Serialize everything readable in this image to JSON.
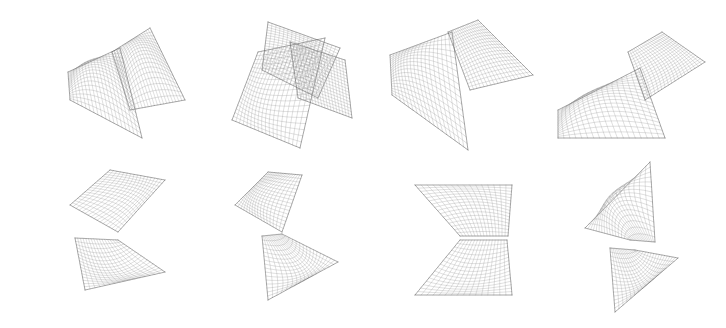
{
  "figure": {
    "background": "#ffffff",
    "line_color": "#8a8a8a",
    "dense_color": "#555555",
    "rows": 2,
    "columns": 4
  },
  "surfaces": [
    {
      "id": "top-1",
      "name": "surface-top-1",
      "grid": 18,
      "patches": [
        {
          "p00": [
            68,
            72
          ],
          "p10": [
            120,
            48
          ],
          "p01": [
            70,
            100
          ],
          "p11": [
            142,
            138
          ],
          "c": [
            96,
            70
          ]
        },
        {
          "p00": [
            112,
            52
          ],
          "p10": [
            150,
            28
          ],
          "p01": [
            130,
            110
          ],
          "p11": [
            185,
            100
          ],
          "c": [
            140,
            55
          ]
        }
      ]
    },
    {
      "id": "top-2",
      "name": "surface-top-2",
      "grid": 18,
      "patches": [
        {
          "p00": [
            258,
            52
          ],
          "p10": [
            325,
            38
          ],
          "p01": [
            232,
            120
          ],
          "p11": [
            300,
            148
          ],
          "c": [
            270,
            95
          ]
        },
        {
          "p00": [
            268,
            22
          ],
          "p10": [
            340,
            48
          ],
          "p01": [
            262,
            70
          ],
          "p11": [
            318,
            98
          ],
          "c": [
            300,
            55
          ]
        },
        {
          "p00": [
            290,
            42
          ],
          "p10": [
            345,
            60
          ],
          "p01": [
            298,
            98
          ],
          "p11": [
            352,
            118
          ],
          "c": [
            320,
            78
          ]
        }
      ]
    },
    {
      "id": "top-3",
      "name": "surface-top-3",
      "grid": 18,
      "patches": [
        {
          "p00": [
            390,
            55
          ],
          "p10": [
            452,
            32
          ],
          "p01": [
            392,
            95
          ],
          "p11": [
            468,
            150
          ],
          "c": [
            418,
            70
          ]
        },
        {
          "p00": [
            448,
            32
          ],
          "p10": [
            478,
            20
          ],
          "p01": [
            470,
            90
          ],
          "p11": [
            533,
            75
          ],
          "c": [
            482,
            50
          ]
        }
      ]
    },
    {
      "id": "top-4",
      "name": "surface-top-4",
      "grid": 18,
      "patches": [
        {
          "p00": [
            558,
            110
          ],
          "p10": [
            640,
            68
          ],
          "p01": [
            558,
            138
          ],
          "p11": [
            665,
            138
          ],
          "c": [
            598,
            98
          ]
        },
        {
          "p00": [
            628,
            52
          ],
          "p10": [
            662,
            32
          ],
          "p01": [
            645,
            100
          ],
          "p11": [
            705,
            62
          ],
          "c": [
            665,
            60
          ]
        }
      ]
    },
    {
      "id": "bottom-1",
      "name": "surface-bottom-1",
      "grid": 16,
      "patches": [
        {
          "p00": [
            70,
            205
          ],
          "p10": [
            110,
            170
          ],
          "p01": [
            118,
            232
          ],
          "p11": [
            165,
            180
          ],
          "c": [
            125,
            195
          ]
        },
        {
          "p00": [
            118,
            240
          ],
          "p10": [
            75,
            238
          ],
          "p01": [
            165,
            272
          ],
          "p11": [
            85,
            290
          ],
          "c": [
            112,
            270
          ]
        }
      ]
    },
    {
      "id": "bottom-2",
      "name": "surface-bottom-2",
      "grid": 16,
      "patches": [
        {
          "p00": [
            235,
            205
          ],
          "p10": [
            268,
            172
          ],
          "p01": [
            282,
            232
          ],
          "p11": [
            302,
            175
          ],
          "c": [
            262,
            195
          ]
        },
        {
          "p00": [
            262,
            236
          ],
          "p10": [
            282,
            234
          ],
          "p01": [
            268,
            300
          ],
          "p11": [
            338,
            262
          ],
          "c": [
            300,
            268
          ]
        }
      ]
    },
    {
      "id": "bottom-3",
      "name": "surface-bottom-3",
      "grid": 16,
      "patches": [
        {
          "p00": [
            415,
            185
          ],
          "p10": [
            512,
            185
          ],
          "p01": [
            460,
            236
          ],
          "p11": [
            508,
            236
          ],
          "c": [
            475,
            205
          ]
        },
        {
          "p00": [
            460,
            240
          ],
          "p10": [
            507,
            240
          ],
          "p01": [
            415,
            295
          ],
          "p11": [
            512,
            295
          ],
          "c": [
            472,
            275
          ]
        }
      ]
    },
    {
      "id": "bottom-4",
      "name": "surface-bottom-4",
      "grid": 16,
      "patches": [
        {
          "p00": [
            585,
            228
          ],
          "p10": [
            650,
            162
          ],
          "p01": [
            630,
            240
          ],
          "p11": [
            655,
            242
          ],
          "c": [
            615,
            200
          ]
        },
        {
          "p00": [
            610,
            248
          ],
          "p10": [
            635,
            250
          ],
          "p01": [
            615,
            312
          ],
          "p11": [
            678,
            258
          ],
          "c": [
            640,
            278
          ]
        }
      ]
    }
  ]
}
